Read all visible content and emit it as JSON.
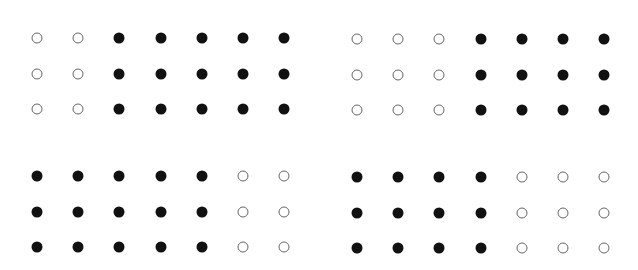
{
  "figure": {
    "colors": {
      "filled": "#111111",
      "open_stroke": "#666666",
      "background": "#ffffff"
    },
    "panels": [
      {
        "id": "top-left",
        "origin": [
          37,
          38
        ],
        "col_spacing": 41.2,
        "row_spacing": 35.5,
        "rows": [
          [
            "open",
            "open",
            "filled",
            "filled",
            "filled",
            "filled",
            "filled"
          ],
          [
            "open",
            "open",
            "filled",
            "filled",
            "filled",
            "filled",
            "filled"
          ],
          [
            "open",
            "open",
            "filled",
            "filled",
            "filled",
            "filled",
            "filled"
          ]
        ],
        "open_count": 6,
        "filled_count": 15
      },
      {
        "id": "top-right",
        "origin": [
          357,
          39
        ],
        "col_spacing": 41.2,
        "row_spacing": 35.5,
        "rows": [
          [
            "open",
            "open",
            "open",
            "filled",
            "filled",
            "filled",
            "filled"
          ],
          [
            "open",
            "open",
            "open",
            "filled",
            "filled",
            "filled",
            "filled"
          ],
          [
            "open",
            "open",
            "open",
            "filled",
            "filled",
            "filled",
            "filled"
          ]
        ],
        "open_count": 9,
        "filled_count": 12
      },
      {
        "id": "bottom-left",
        "origin": [
          37,
          176
        ],
        "col_spacing": 41.2,
        "row_spacing": 35.5,
        "rows": [
          [
            "filled",
            "filled",
            "filled",
            "filled",
            "filled",
            "open",
            "open"
          ],
          [
            "filled",
            "filled",
            "filled",
            "filled",
            "filled",
            "open",
            "open"
          ],
          [
            "filled",
            "filled",
            "filled",
            "filled",
            "filled",
            "open",
            "open"
          ]
        ],
        "open_count": 6,
        "filled_count": 15
      },
      {
        "id": "bottom-right",
        "origin": [
          357,
          177
        ],
        "col_spacing": 41.2,
        "row_spacing": 35.5,
        "rows": [
          [
            "filled",
            "filled",
            "filled",
            "filled",
            "open",
            "open",
            "open"
          ],
          [
            "filled",
            "filled",
            "filled",
            "filled",
            "open",
            "open",
            "open"
          ],
          [
            "filled",
            "filled",
            "filled",
            "filled",
            "open",
            "open",
            "open"
          ]
        ],
        "open_count": 9,
        "filled_count": 12
      }
    ]
  }
}
